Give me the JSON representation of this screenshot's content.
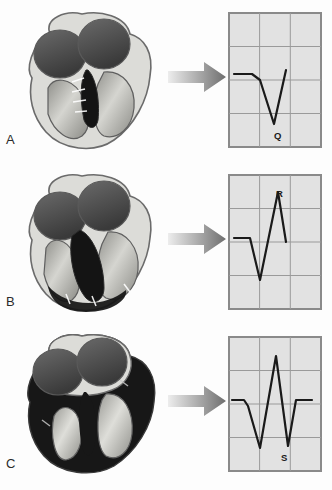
{
  "figure": {
    "background_color": "#fdfdfd",
    "panel_count": 3
  },
  "style": {
    "ecg_background": "#e2e2e2",
    "ecg_border": "#8a8a8a",
    "ecg_gridline": "#9a9a9a",
    "trace_color": "#1a1a1a",
    "arrow_light": "#e8e8e8",
    "arrow_dark": "#6e6e6e",
    "heart_outline": "#6b6b6b",
    "myocardium_light": "#d8d8d4",
    "chamber_dark": "#4a4a4a",
    "chamber_mid": "#9d9d9d",
    "depolarized_dark": "#171717",
    "label_color": "#2b2b2b"
  },
  "panels": [
    {
      "letter": "A",
      "heart": {
        "depolarized_region": "septum",
        "left_atrium_shade": "#4f4f4f",
        "right_atrium_shade": "#464646",
        "ventricle_shade": "#b9b9b4",
        "septum_shade": "#141414",
        "has_conduction_fibers": true
      },
      "arrow": {
        "direction": "right"
      },
      "ecg": {
        "grid_cols": 3,
        "grid_rows": 4,
        "labels": [
          {
            "text": "Q",
            "x": 46,
            "y": 118
          }
        ],
        "trace_points": "6,62 24,62 32,68 46,112 58,58"
      }
    },
    {
      "letter": "B",
      "heart": {
        "depolarized_region": "septum-and-apex",
        "left_atrium_shade": "#4f4f4f",
        "right_atrium_shade": "#464646",
        "ventricle_shade": "#b9b9b4",
        "septum_shade": "#141414",
        "has_conduction_fibers": true
      },
      "arrow": {
        "direction": "right"
      },
      "ecg": {
        "grid_cols": 3,
        "grid_rows": 4,
        "labels": [
          {
            "text": "R",
            "x": 48,
            "y": 14
          }
        ],
        "trace_points": "6,64 22,64 32,106 50,18 58,68"
      }
    },
    {
      "letter": "C",
      "heart": {
        "depolarized_region": "ventricular-walls",
        "left_atrium_shade": "#4f4f4f",
        "right_atrium_shade": "#464646",
        "ventricle_shade": "#c2c2bd",
        "septum_shade": "#141414",
        "has_conduction_fibers": true
      },
      "arrow": {
        "direction": "right"
      },
      "ecg": {
        "grid_cols": 3,
        "grid_rows": 4,
        "labels": [
          {
            "text": "S",
            "x": 53,
            "y": 116
          }
        ],
        "trace_points": "4,64 16,64 20,70 32,112 48,20 60,110 68,64 84,64"
      }
    }
  ]
}
